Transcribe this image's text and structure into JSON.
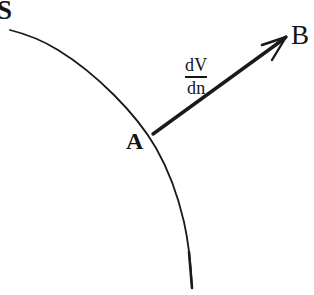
{
  "figure": {
    "type": "geometry-diagram",
    "background_color": "#ffffff",
    "ink_color": "#141414",
    "width": 314,
    "height": 295,
    "labels": {
      "surface": "S",
      "point": "A",
      "arrow_head_point": "B",
      "vector_numerator": "dV",
      "vector_denominator": "dn"
    },
    "geometry": {
      "curve_name": "surface-curve-S",
      "curve_path": "M 10 30 C 48 42 96 78 134 118 C 160 146 182 200 192 288",
      "curve_stroke_width": 1.8,
      "arrow_name": "normal-derivative-vector",
      "arrow_start": [
        153,
        134
      ],
      "arrow_end": [
        286,
        38
      ],
      "arrow_stroke_width": 3.4
    }
  }
}
